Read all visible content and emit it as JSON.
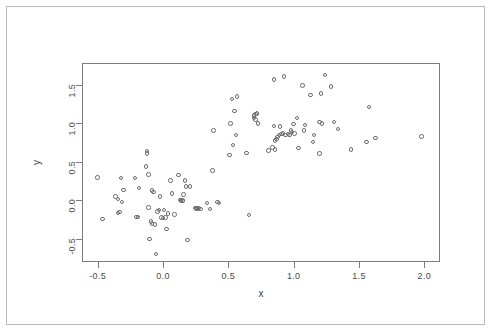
{
  "figure": {
    "background_color": "#ffffff",
    "frame_color": "#b9b9b9",
    "axis_color": "#7d7d7d",
    "point_color": "#6e6e6e"
  },
  "chart_data": {
    "type": "scatter",
    "title": "",
    "xlabel": "x",
    "ylabel": "y",
    "xlim": [
      -0.62,
      2.12
    ],
    "ylim": [
      -0.8,
      1.78
    ],
    "xticks": [
      -0.5,
      0.0,
      0.5,
      1.0,
      1.5,
      2.0
    ],
    "xtick_labels": [
      "-0.5",
      "0.0",
      "0.5",
      "1.0",
      "1.5",
      "2.0"
    ],
    "yticks": [
      -0.5,
      0.0,
      0.5,
      1.0,
      1.5
    ],
    "ytick_labels": [
      "-0.5",
      "0.0",
      "0.5",
      "1.0",
      "1.5"
    ],
    "grid": false,
    "legend": null,
    "marker": "open-circle",
    "n_points": 120,
    "points": [
      [
        -0.51,
        0.31
      ],
      [
        -0.47,
        -0.23
      ],
      [
        -0.37,
        0.06
      ],
      [
        -0.35,
        0.03
      ],
      [
        -0.35,
        -0.15
      ],
      [
        -0.34,
        -0.14
      ],
      [
        -0.33,
        0.3
      ],
      [
        -0.32,
        -0.01
      ],
      [
        -0.31,
        0.15
      ],
      [
        -0.22,
        0.3
      ],
      [
        -0.21,
        -0.2
      ],
      [
        -0.2,
        -0.2
      ],
      [
        -0.19,
        0.17
      ],
      [
        -0.14,
        0.45
      ],
      [
        -0.13,
        0.62
      ],
      [
        -0.13,
        0.65
      ],
      [
        -0.12,
        -0.08
      ],
      [
        -0.12,
        0.35
      ],
      [
        -0.11,
        -0.49
      ],
      [
        -0.1,
        -0.26
      ],
      [
        -0.09,
        0.14
      ],
      [
        -0.09,
        -0.29
      ],
      [
        -0.08,
        0.12
      ],
      [
        -0.07,
        -0.3
      ],
      [
        -0.06,
        -0.68
      ],
      [
        -0.05,
        -0.13
      ],
      [
        -0.04,
        -0.11
      ],
      [
        -0.03,
        0.06
      ],
      [
        -0.02,
        -0.21
      ],
      [
        -0.01,
        -0.22
      ],
      [
        0.0,
        -0.11
      ],
      [
        0.01,
        -0.21
      ],
      [
        0.02,
        -0.36
      ],
      [
        0.03,
        -0.16
      ],
      [
        0.05,
        0.27
      ],
      [
        0.06,
        0.1
      ],
      [
        0.08,
        -0.17
      ],
      [
        0.11,
        0.34
      ],
      [
        0.12,
        0.02
      ],
      [
        0.13,
        0.01
      ],
      [
        0.14,
        0.0
      ],
      [
        0.14,
        0.01
      ],
      [
        0.15,
        0.09
      ],
      [
        0.16,
        0.27
      ],
      [
        0.17,
        0.19
      ],
      [
        0.18,
        -0.5
      ],
      [
        0.2,
        0.19
      ],
      [
        0.24,
        -0.09
      ],
      [
        0.25,
        -0.09
      ],
      [
        0.25,
        -0.1
      ],
      [
        0.26,
        -0.1
      ],
      [
        0.27,
        -0.09
      ],
      [
        0.28,
        -0.1
      ],
      [
        0.33,
        -0.02
      ],
      [
        0.35,
        -0.1
      ],
      [
        0.37,
        0.4
      ],
      [
        0.38,
        0.92
      ],
      [
        0.41,
        -0.01
      ],
      [
        0.42,
        -0.02
      ],
      [
        0.5,
        0.6
      ],
      [
        0.51,
        1.01
      ],
      [
        0.52,
        1.33
      ],
      [
        0.53,
        0.73
      ],
      [
        0.54,
        1.17
      ],
      [
        0.55,
        0.86
      ],
      [
        0.56,
        1.36
      ],
      [
        0.63,
        0.63
      ],
      [
        0.65,
        -0.18
      ],
      [
        0.69,
        1.11
      ],
      [
        0.69,
        1.08
      ],
      [
        0.7,
        1.13
      ],
      [
        0.7,
        1.06
      ],
      [
        0.71,
        1.14
      ],
      [
        0.72,
        1.01
      ],
      [
        0.8,
        0.66
      ],
      [
        0.83,
        0.7
      ],
      [
        0.84,
        1.58
      ],
      [
        0.84,
        0.98
      ],
      [
        0.85,
        0.67
      ],
      [
        0.85,
        0.79
      ],
      [
        0.86,
        0.81
      ],
      [
        0.87,
        0.83
      ],
      [
        0.88,
        0.86
      ],
      [
        0.89,
        0.97
      ],
      [
        0.9,
        0.87
      ],
      [
        0.91,
        0.88
      ],
      [
        0.92,
        1.62
      ],
      [
        0.93,
        0.86
      ],
      [
        0.95,
        0.87
      ],
      [
        0.96,
        0.86
      ],
      [
        0.97,
        0.92
      ],
      [
        0.98,
        0.9
      ],
      [
        0.99,
        1.0
      ],
      [
        1.0,
        0.88
      ],
      [
        1.02,
        1.08
      ],
      [
        1.03,
        0.69
      ],
      [
        1.06,
        1.5
      ],
      [
        1.07,
        0.92
      ],
      [
        1.08,
        0.99
      ],
      [
        1.12,
        1.38
      ],
      [
        1.14,
        0.77
      ],
      [
        1.15,
        0.86
      ],
      [
        1.19,
        1.03
      ],
      [
        1.19,
        0.62
      ],
      [
        1.2,
        1.4
      ],
      [
        1.21,
        1.01
      ],
      [
        1.23,
        1.64
      ],
      [
        1.28,
        1.49
      ],
      [
        1.3,
        1.03
      ],
      [
        1.33,
        0.94
      ],
      [
        1.43,
        0.67
      ],
      [
        1.55,
        0.77
      ],
      [
        1.57,
        1.22
      ],
      [
        1.62,
        0.82
      ],
      [
        1.97,
        0.84
      ]
    ]
  }
}
